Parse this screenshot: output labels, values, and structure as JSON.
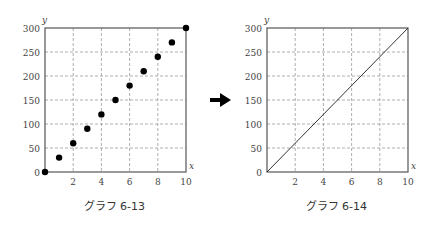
{
  "chart_data": [
    {
      "type": "scatter",
      "caption": "グラフ 6-13",
      "xlabel": "x",
      "ylabel": "y",
      "xlim": [
        0,
        10
      ],
      "ylim": [
        0,
        300
      ],
      "xticks": [
        2,
        4,
        6,
        8,
        10
      ],
      "yticks": [
        0,
        50,
        100,
        150,
        200,
        250,
        300
      ],
      "grid": true,
      "x": [
        0,
        1,
        2,
        3,
        4,
        5,
        6,
        7,
        8,
        9,
        10
      ],
      "y": [
        0,
        30,
        60,
        90,
        120,
        150,
        180,
        210,
        240,
        270,
        300
      ]
    },
    {
      "type": "line",
      "caption": "グラフ 6-14",
      "xlabel": "x",
      "ylabel": "y",
      "xlim": [
        0,
        10
      ],
      "ylim": [
        0,
        300
      ],
      "xticks": [
        2,
        4,
        6,
        8,
        10
      ],
      "yticks": [
        0,
        50,
        100,
        150,
        200,
        250,
        300
      ],
      "grid": true,
      "x": [
        0,
        10
      ],
      "y": [
        0,
        300
      ]
    }
  ],
  "arrow": {
    "icon": "right-arrow-icon"
  },
  "frames": [
    {
      "left": 45,
      "top": 28,
      "right": 186,
      "bottom": 172
    },
    {
      "left": 267,
      "top": 28,
      "right": 408,
      "bottom": 172
    }
  ]
}
